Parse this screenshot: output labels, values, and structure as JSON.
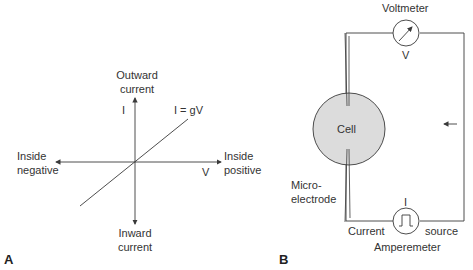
{
  "panel_a": {
    "letter": "A",
    "y_axis_label": "I",
    "y_top_line1": "Outward",
    "y_top_line2": "current",
    "y_bottom_line1": "Inward",
    "y_bottom_line2": "current",
    "x_axis_label": "V",
    "x_left_line1": "Inside",
    "x_left_line2": "negative",
    "x_right_line1": "Inside",
    "x_right_line2": "positive",
    "equation": "I = gV"
  },
  "panel_b": {
    "letter": "B",
    "voltmeter_label": "Voltmeter",
    "voltmeter_symbol": "V",
    "cell_label": "Cell",
    "electrode_line1": "Micro-",
    "electrode_line2": "electrode",
    "current_symbol": "I",
    "current_left": "Current",
    "current_right": "source",
    "amperemeter_label": "Amperemeter"
  },
  "colors": {
    "line": "#3a3a3a",
    "cell_fill": "#dcdcdc"
  }
}
